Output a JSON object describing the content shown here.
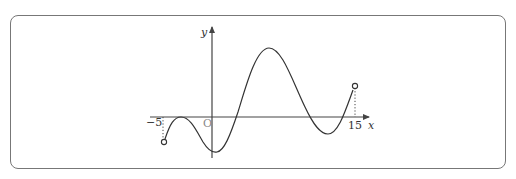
{
  "diagram": {
    "axis_labels": {
      "x": "x",
      "y": "y"
    },
    "origin_label": "O",
    "tick_labels": {
      "left": "−5",
      "right": "15"
    },
    "colors": {
      "curve": "#333333",
      "axis": "#444444",
      "frame": "#777777"
    },
    "endpoints": "open circles at x=−5 and x=15"
  }
}
